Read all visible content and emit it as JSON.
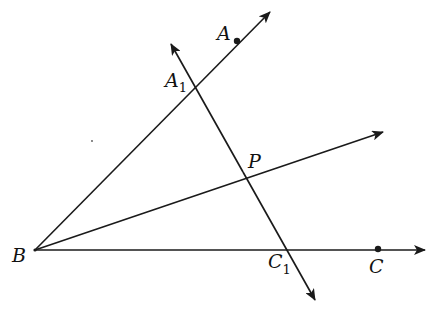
{
  "diagram": {
    "type": "geometry-angle-bisector",
    "colors": {
      "stroke": "#1a1a1a",
      "text": "#111111",
      "background": "#ffffff"
    },
    "points": {
      "B": {
        "label": "B",
        "subscript": ""
      },
      "A": {
        "label": "A",
        "subscript": ""
      },
      "C": {
        "label": "C",
        "subscript": ""
      },
      "P": {
        "label": "P",
        "subscript": ""
      },
      "A1": {
        "label": "A",
        "subscript": "1"
      },
      "C1": {
        "label": "C",
        "subscript": "1"
      }
    },
    "rays": [
      {
        "name": "ray-BA",
        "from": "B",
        "through": "A"
      },
      {
        "name": "ray-BP",
        "from": "B",
        "through": "P"
      },
      {
        "name": "ray-BC",
        "from": "B",
        "through": "C"
      }
    ],
    "lines": [
      {
        "name": "line-A1C1",
        "through": [
          "A1",
          "C1"
        ],
        "intersects": "P"
      }
    ],
    "marked_points": [
      "A",
      "C"
    ]
  }
}
